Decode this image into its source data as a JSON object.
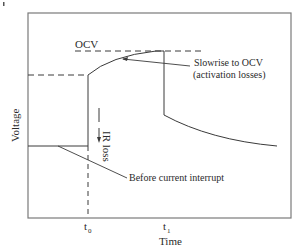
{
  "diagram": {
    "axes": {
      "xlabel": "Time",
      "ylabel": "Voltage",
      "x_ticks": [
        {
          "label": "t",
          "sub": "0"
        },
        {
          "label": "t",
          "sub": "1"
        }
      ]
    },
    "labels": {
      "ocv": "OCV",
      "ir_loss": "IR loss",
      "slow_rise_line1": "Slowrise to OCV",
      "slow_rise_line2": "(activation losses)",
      "before_interrupt": "Before current interrupt"
    },
    "colors": {
      "line": "#3a3a3a",
      "frame": "#777777",
      "text": "#2a2a2a",
      "background": "#ffffff"
    }
  }
}
